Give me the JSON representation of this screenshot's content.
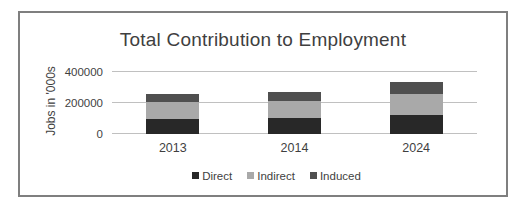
{
  "chart_data": {
    "type": "bar",
    "stacked": true,
    "title": "Total Contribution to Employment",
    "xlabel": "",
    "ylabel": "Jobs in '000s",
    "categories": [
      "2013",
      "2014",
      "2024"
    ],
    "series": [
      {
        "name": "Direct",
        "color": "#282828",
        "values": [
          100000,
          105000,
          125000
        ]
      },
      {
        "name": "Indirect",
        "color": "#a9a9a9",
        "values": [
          105000,
          105000,
          135000
        ]
      },
      {
        "name": "Induced",
        "color": "#4f4f4f",
        "values": [
          55000,
          60000,
          75000
        ]
      }
    ],
    "ylim": [
      0,
      400000
    ],
    "yticks": [
      0,
      200000,
      400000
    ],
    "ytick_labels": [
      "0",
      "200000",
      "400000"
    ],
    "grid": true,
    "legend_position": "bottom",
    "colors": {
      "gridline": "#c0c0c0",
      "text": "#3f3f3f",
      "frame_border": "#7f7f7f",
      "background": "#ffffff"
    }
  }
}
